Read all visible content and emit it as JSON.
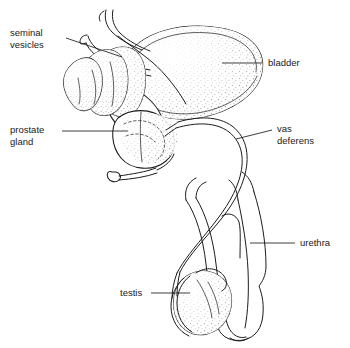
{
  "figure": {
    "style": "black and white stippled anatomical line illustration",
    "background_color": "#ffffff",
    "ink_color": "#1c1c1c",
    "width": 350,
    "height": 348
  },
  "labels": [
    {
      "id": "seminal-vesicles",
      "lines": [
        "seminal",
        "vesicles"
      ],
      "line1": "seminal",
      "line2": "vesicles",
      "text_x": 10,
      "text_y": 36,
      "align": "left",
      "leader": "M 66 38 L 122 57",
      "target": "seminal vesicles"
    },
    {
      "id": "prostate-gland",
      "lines": [
        "prostate",
        "gland"
      ],
      "line1": "prostate",
      "line2": "gland",
      "text_x": 10,
      "text_y": 133,
      "align": "left",
      "leader": "M 62 131 L 128 131",
      "target": "prostate gland"
    },
    {
      "id": "bladder",
      "lines": [
        "bladder"
      ],
      "line1": "bladder",
      "line2": "",
      "text_x": 268,
      "text_y": 66,
      "align": "left",
      "leader": "M 262 63 L 222 63",
      "target": "urinary bladder"
    },
    {
      "id": "vas-deferens",
      "lines": [
        "vas",
        "deferens"
      ],
      "line1": "vas",
      "line2": "deferens",
      "text_x": 277,
      "text_y": 132,
      "align": "left",
      "leader": "M 272 130 L 236 139",
      "target": "vas deferens"
    },
    {
      "id": "urethra",
      "lines": [
        "urethra"
      ],
      "line1": "urethra",
      "line2": "",
      "text_x": 300,
      "text_y": 246,
      "align": "left",
      "leader": "M 295 243 L 250 243",
      "target": "urethra"
    },
    {
      "id": "testis",
      "lines": [
        "testis"
      ],
      "line1": "testis",
      "line2": "",
      "text_x": 120,
      "text_y": 296,
      "align": "left",
      "leader": "M 151 293 L 190 293",
      "target": "testis"
    }
  ],
  "structures": [
    {
      "id": "bladder",
      "name": "bladder",
      "shading": "stipple"
    },
    {
      "id": "seminal-vesicles",
      "name": "seminal vesicles",
      "shading": "stipple"
    },
    {
      "id": "prostate-gland",
      "name": "prostate gland",
      "shading": "stipple"
    },
    {
      "id": "vas-deferens",
      "name": "vas deferens",
      "shading": "outline"
    },
    {
      "id": "ureters",
      "name": "ureters",
      "shading": "outline"
    },
    {
      "id": "urethra",
      "name": "urethra",
      "shading": "outline"
    },
    {
      "id": "penis",
      "name": "penis",
      "shading": "outline"
    },
    {
      "id": "testis",
      "name": "testis",
      "shading": "stipple"
    },
    {
      "id": "epididymis",
      "name": "epididymis",
      "shading": "outline"
    },
    {
      "id": "bulbourethral-gland",
      "name": "bulbourethral gland",
      "shading": "outline"
    }
  ]
}
